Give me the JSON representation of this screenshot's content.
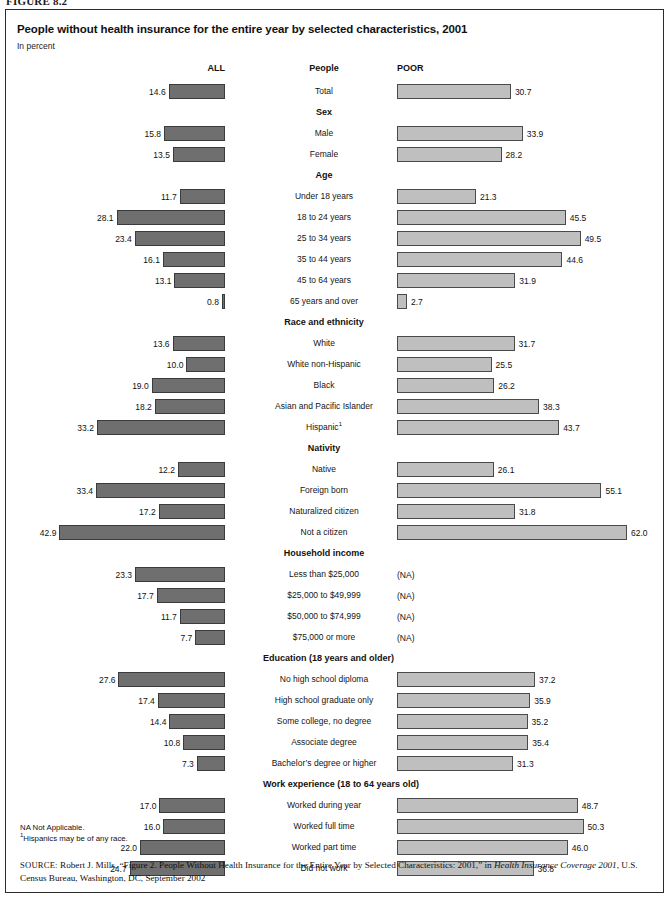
{
  "figure_label": "FIGURE 8.2",
  "chart": {
    "title": "People without health insurance for the entire year by selected characteristics, 2001",
    "subtitle": "In percent",
    "columns": {
      "left_header": "ALL",
      "center_header": "People",
      "right_header": "POOR"
    }
  },
  "notes": {
    "na": "NA Not Applicable.",
    "footnote_marker": "1",
    "footnote_text": "Hispanics may be of any race."
  },
  "source": {
    "label": "SOURCE:",
    "text_before_italic": " Robert J. Mills, “Figure 2. People Without Health Insurance for the Entire Year by Selected Characteristics: 2001,” in ",
    "italic_title": "Health Insurance Coverage 2001",
    "text_after_italic": ", U.S. Census Bureau, Washington, DC, September 2002"
  },
  "chart_data": {
    "type": "bar",
    "title": "People without health insurance for the entire year by selected characteristics, 2001",
    "subtitle": "In percent",
    "xlabel": "Percent",
    "ylabel": "",
    "orientation": "horizontal",
    "grid": false,
    "legend_position": "column-headers",
    "series": [
      {
        "name": "ALL",
        "align": "right",
        "color": "#6f6f6f"
      },
      {
        "name": "POOR",
        "align": "left",
        "color": "#bfbfbf"
      }
    ],
    "not_applicable_label": "(NA)",
    "sections": [
      {
        "heading": "People",
        "is_column_header": true,
        "rows": [
          {
            "label": "Total",
            "all": 14.6,
            "poor": 30.7
          }
        ]
      },
      {
        "heading": "Sex",
        "rows": [
          {
            "label": "Male",
            "all": 15.8,
            "poor": 33.9
          },
          {
            "label": "Female",
            "all": 13.5,
            "poor": 28.2
          }
        ]
      },
      {
        "heading": "Age",
        "rows": [
          {
            "label": "Under 18 years",
            "all": 11.7,
            "poor": 21.3
          },
          {
            "label": "18 to 24 years",
            "all": 28.1,
            "poor": 45.5
          },
          {
            "label": "25 to 34 years",
            "all": 23.4,
            "poor": 49.5
          },
          {
            "label": "35 to 44 years",
            "all": 16.1,
            "poor": 44.6
          },
          {
            "label": "45 to 64 years",
            "all": 13.1,
            "poor": 31.9
          },
          {
            "label": "65 years and over",
            "all": 0.8,
            "poor": 2.7
          }
        ]
      },
      {
        "heading": "Race and ethnicity",
        "rows": [
          {
            "label": "White",
            "all": 13.6,
            "poor": 31.7
          },
          {
            "label": "White non-Hispanic",
            "all": 10.0,
            "poor": 25.5
          },
          {
            "label": "Black",
            "all": 19.0,
            "poor": 26.2
          },
          {
            "label": "Asian and Pacific Islander",
            "all": 18.2,
            "poor": 38.3
          },
          {
            "label": "Hispanic",
            "footnote": "1",
            "all": 33.2,
            "poor": 43.7
          }
        ]
      },
      {
        "heading": "Nativity",
        "rows": [
          {
            "label": "Native",
            "all": 12.2,
            "poor": 26.1
          },
          {
            "label": "Foreign born",
            "all": 33.4,
            "poor": 55.1
          },
          {
            "label": "Naturalized citizen",
            "all": 17.2,
            "poor": 31.8
          },
          {
            "label": "Not a citizen",
            "all": 42.9,
            "poor": 62.0
          }
        ]
      },
      {
        "heading": "Household income",
        "rows": [
          {
            "label": "Less than $25,000",
            "all": 23.3,
            "poor": null
          },
          {
            "label": "$25,000 to $49,999",
            "all": 17.7,
            "poor": null
          },
          {
            "label": "$50,000 to $74,999",
            "all": 11.7,
            "poor": null
          },
          {
            "label": "$75,000 or more",
            "all": 7.7,
            "poor": null
          }
        ]
      },
      {
        "heading": "Education (18 years and older)",
        "rows": [
          {
            "label": "No high school diploma",
            "all": 27.6,
            "poor": 37.2
          },
          {
            "label": "High school graduate only",
            "all": 17.4,
            "poor": 35.9
          },
          {
            "label": "Some college, no degree",
            "all": 14.4,
            "poor": 35.2
          },
          {
            "label": "Associate degree",
            "all": 10.8,
            "poor": 35.4
          },
          {
            "label": "Bachelor’s degree or higher",
            "all": 7.3,
            "poor": 31.3
          }
        ]
      },
      {
        "heading": "Work experience (18 to 64 years old)",
        "rows": [
          {
            "label": "Worked during year",
            "all": 17.0,
            "poor": 48.7
          },
          {
            "label": "Worked full time",
            "all": 16.0,
            "poor": 50.3
          },
          {
            "label": "Worked part time",
            "all": 22.0,
            "poor": 46.0
          },
          {
            "label": "Did not work",
            "all": 24.7,
            "poor": 36.8
          }
        ]
      }
    ]
  }
}
